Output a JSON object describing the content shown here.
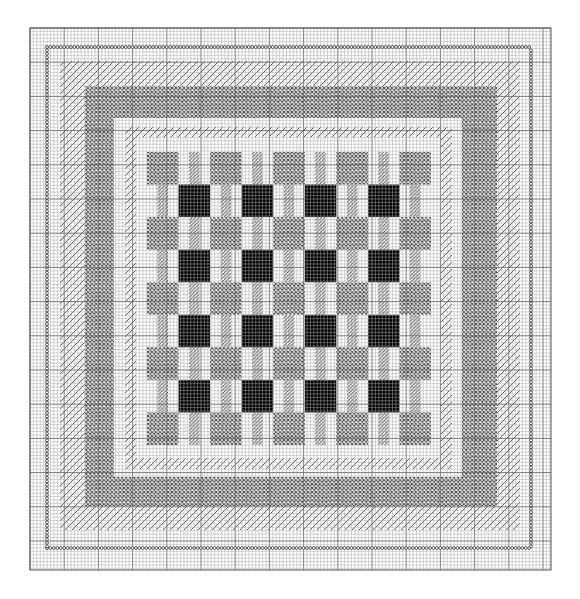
{
  "chart": {
    "title": "",
    "kind": "needlepoint chart",
    "canvas": {
      "width": 580,
      "height": 599,
      "background": "#ffffff"
    },
    "grid": {
      "x0": 30,
      "y0": 28,
      "x1": 551,
      "y1": 570,
      "cell": 3.42,
      "major_every": 10,
      "minor_color": "#a8a8a8",
      "major_color": "#6e6e6e"
    },
    "colors": {
      "crosshatch": "#555555",
      "hatch": "#444444",
      "black": "#000000",
      "circle": "#333333",
      "white": "#ffffff"
    },
    "borders": [
      {
        "name": "circle-border",
        "type": "circles",
        "x0": 47,
        "y0": 47,
        "x1": 531,
        "y1": 548
      },
      {
        "name": "outer-hatch-band",
        "type": "hatch",
        "outer": [
          60,
          61,
          520,
          530
        ],
        "inner": [
          85,
          86,
          497,
          506
        ]
      },
      {
        "name": "crosshatch-band",
        "type": "crosshatch",
        "outer": [
          85,
          86,
          497,
          506
        ],
        "inner": [
          114,
          118,
          462,
          477
        ]
      },
      {
        "name": "inner-hatch-band",
        "type": "hatch",
        "outer": [
          125,
          127,
          452,
          469
        ],
        "inner": [
          136,
          137,
          441,
          458
        ]
      }
    ],
    "center": {
      "x0": 147,
      "y0": 152,
      "x1": 431,
      "y1": 445,
      "rows": 9,
      "cols": 9,
      "row_pattern": [
        "G.G.G.G.G",
        ".B.B.B.B.",
        "G.G.G.G.G",
        ".B.B.B.B.",
        "G.G.G.G.G",
        ".B.B.B.B.",
        "G.G.G.G.G",
        ".B.B.B.B.",
        "G.G.G.G.G"
      ],
      "legend": {
        "G": "gray crosshatch square",
        "B": "solid black square",
        ".": "white cell with vertical hatch stripe"
      },
      "stripe_width_ratio": 0.34
    }
  }
}
